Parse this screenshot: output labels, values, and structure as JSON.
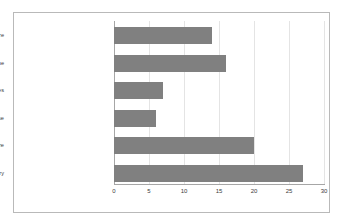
{
  "chart_data": {
    "type": "bar",
    "orientation": "horizontal",
    "title": "",
    "xlabel": "",
    "ylabel": "",
    "categories": [
      "Maternity and Child care",
      "Alternative medicine",
      "Chronic diseases",
      "epidemic of infectious disease",
      "Diseases and cure",
      "dietry"
    ],
    "values": [
      14,
      16,
      7,
      6,
      20,
      27
    ],
    "xlim": [
      0,
      30
    ],
    "xticks": [
      0,
      5,
      10,
      15,
      20,
      25,
      30
    ],
    "xtick_labels": [
      "0",
      "5",
      "10",
      "15",
      "20",
      "25",
      "30"
    ],
    "grid": true,
    "legend": false,
    "bar_color": "#808080",
    "gridline_color": "#e4e4e4",
    "axis_color": "#a6a6a6",
    "text_color": "#3a3a3a",
    "border_color": "#b9b9b9",
    "background_color": "#ffffff"
  }
}
